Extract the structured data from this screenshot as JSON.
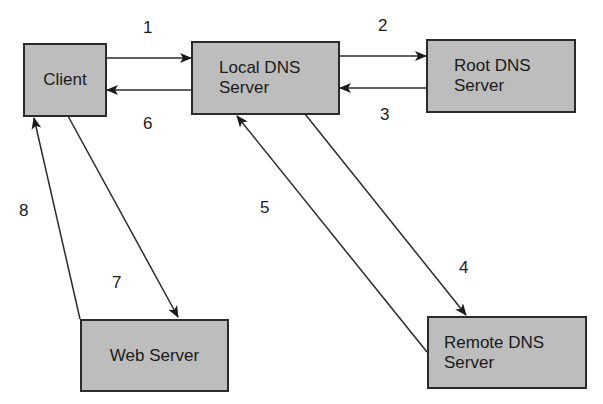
{
  "diagram": {
    "type": "DNS resolution flow",
    "nodes": {
      "client": {
        "line1": "Client",
        "line2": ""
      },
      "local_dns": {
        "line1": "Local DNS",
        "line2": "Server"
      },
      "root_dns": {
        "line1": "Root DNS",
        "line2": "Server"
      },
      "web_server": {
        "line1": "Web Server",
        "line2": ""
      },
      "remote_dns": {
        "line1": "Remote DNS",
        "line2": "Server"
      }
    },
    "steps": [
      {
        "n": "1",
        "from": "Client",
        "to": "Local DNS Server"
      },
      {
        "n": "2",
        "from": "Local DNS Server",
        "to": "Root DNS Server"
      },
      {
        "n": "3",
        "from": "Root DNS Server",
        "to": "Local DNS Server"
      },
      {
        "n": "4",
        "from": "Local DNS Server",
        "to": "Remote DNS Server"
      },
      {
        "n": "5",
        "from": "Remote DNS Server",
        "to": "Local DNS Server"
      },
      {
        "n": "6",
        "from": "Local DNS Server",
        "to": "Client"
      },
      {
        "n": "7",
        "from": "Client",
        "to": "Web Server"
      },
      {
        "n": "8",
        "from": "Web Server",
        "to": "Client"
      }
    ],
    "colors": {
      "box_fill": "#bdbdbd",
      "stroke": "#2b2b2b"
    }
  }
}
